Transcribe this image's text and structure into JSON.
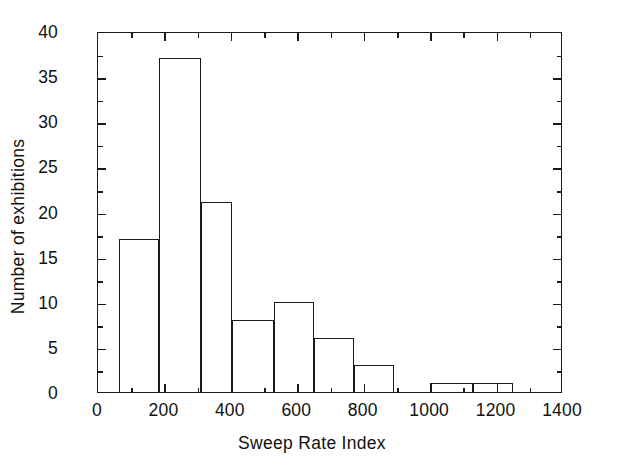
{
  "chart_data": {
    "type": "bar",
    "title": "",
    "xlabel": "Sweep Rate Index",
    "ylabel": "Number of exhibitions",
    "xlim": [
      0,
      1400
    ],
    "ylim": [
      0,
      40
    ],
    "grid": false,
    "legend": null,
    "x_ticks": [
      0,
      200,
      400,
      600,
      800,
      1000,
      1200,
      1400
    ],
    "x_tick_labels": [
      "0",
      "200",
      "400",
      "600",
      "800",
      "1000",
      "1200",
      "1400"
    ],
    "x_minor_tick_step": 100,
    "y_ticks": [
      0,
      5,
      10,
      15,
      20,
      25,
      30,
      35,
      40
    ],
    "y_tick_labels": [
      "0",
      "5",
      "10",
      "15",
      "20",
      "25",
      "30",
      "35",
      "40"
    ],
    "y_minor_tick_step": 2.5,
    "bins": [
      {
        "x0": 63,
        "x1": 185,
        "value": 17
      },
      {
        "x0": 185,
        "x1": 310,
        "value": 37
      },
      {
        "x0": 310,
        "x1": 402,
        "value": 21
      },
      {
        "x0": 402,
        "x1": 530,
        "value": 8
      },
      {
        "x0": 530,
        "x1": 650,
        "value": 10
      },
      {
        "x0": 650,
        "x1": 770,
        "value": 6
      },
      {
        "x0": 770,
        "x1": 890,
        "value": 3
      },
      {
        "x0": 1000,
        "x1": 1130,
        "value": 1
      },
      {
        "x0": 1130,
        "x1": 1250,
        "value": 1
      }
    ],
    "categories": [
      "63-185",
      "185-310",
      "310-402",
      "402-530",
      "530-650",
      "650-770",
      "770-890",
      "1000-1130",
      "1130-1250"
    ],
    "values": [
      17,
      37,
      21,
      8,
      10,
      6,
      3,
      1,
      1
    ],
    "colors": {
      "line": "#1a1a1a",
      "fill": "none",
      "background": "#ffffff"
    }
  }
}
